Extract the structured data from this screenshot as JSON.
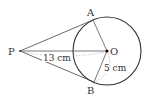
{
  "diagram": {
    "type": "circle-tangents",
    "points": {
      "P": {
        "label": "P",
        "x": 20,
        "y": 51
      },
      "O": {
        "label": "O",
        "x": 107,
        "y": 51
      },
      "A": {
        "label": "A",
        "x": 93,
        "y": 20
      },
      "B": {
        "label": "B",
        "x": 94,
        "y": 82
      }
    },
    "circle": {
      "cx": 107,
      "cy": 51,
      "r": 34
    },
    "labels": {
      "distance_PO": "13 cm",
      "radius": "5 cm"
    },
    "colors": {
      "stroke": "#333333",
      "dotted": "#aaaaaa"
    }
  }
}
